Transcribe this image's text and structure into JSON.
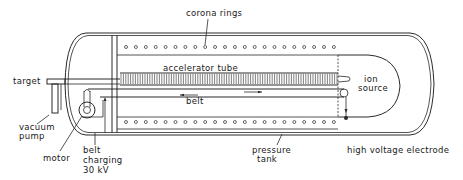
{
  "diagram": {
    "labels": {
      "corona_rings": "corona rings",
      "accelerator_tube": "accelerator tube",
      "belt": "belt",
      "ion_source_1": "ion",
      "ion_source_2": "source",
      "target": "target",
      "vacuum_pump_1": "vacuum",
      "vacuum_pump_2": "pump",
      "motor": "motor",
      "belt_charging_1": "belt",
      "belt_charging_2": "charging",
      "belt_charging_3": "30 kV",
      "pressure_tank_1": "pressure",
      "pressure_tank_2": "tank",
      "high_voltage_electrode": "high voltage electrode"
    },
    "components": [
      "pressure tank",
      "corona rings",
      "accelerator tube",
      "belt",
      "ion source",
      "target",
      "vacuum pump",
      "motor",
      "belt charging",
      "high voltage electrode"
    ],
    "colors": {
      "line": "#2a2a2a",
      "background": "#ffffff"
    }
  }
}
